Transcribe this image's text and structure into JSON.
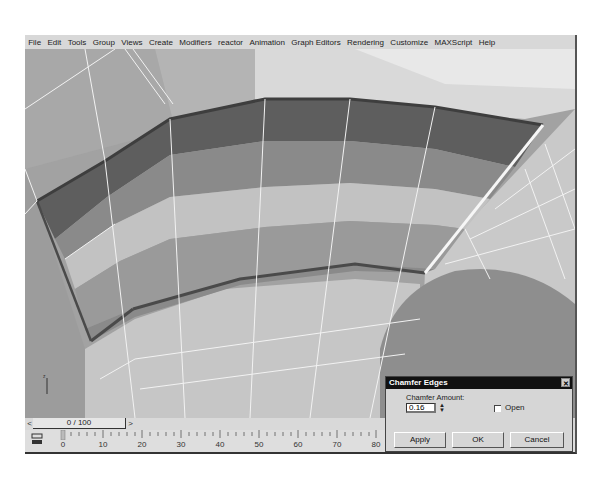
{
  "menubar": {
    "items": [
      {
        "label": "File",
        "accel": "F"
      },
      {
        "label": "Edit",
        "accel": "E"
      },
      {
        "label": "Tools",
        "accel": "T"
      },
      {
        "label": "Group",
        "accel": "G"
      },
      {
        "label": "Views",
        "accel": "V"
      },
      {
        "label": "Create",
        "accel": "C"
      },
      {
        "label": "Modifiers",
        "accel": "o"
      },
      {
        "label": "reactor",
        "accel": ""
      },
      {
        "label": "Animation",
        "accel": "A"
      },
      {
        "label": "Graph Editors",
        "accel": ""
      },
      {
        "label": "Rendering",
        "accel": "R"
      },
      {
        "label": "Customize",
        "accel": "u"
      },
      {
        "label": "MAXScript",
        "accel": "M"
      },
      {
        "label": "Help",
        "accel": "H"
      }
    ]
  },
  "viewport": {
    "axis_label": "z",
    "colors": {
      "background": "#9a9a9a",
      "selected_dark_faces": "#5c5c5c",
      "selected_mid_faces": "#8a8a8a",
      "selected_light_faces": "#bdbdbd",
      "wire": "#f2f2f2",
      "outline": "#4a4a4a"
    }
  },
  "timeslider": {
    "left_arrow": "<",
    "right_arrow": ">",
    "position_label": "0 / 100"
  },
  "trackbar": {
    "ticks": [
      "0",
      "10",
      "20",
      "30",
      "40",
      "50",
      "60",
      "70",
      "80"
    ]
  },
  "dialog": {
    "title": "Chamfer Edges",
    "close_glyph": "✕",
    "amount_label": "Chamfer Amount:",
    "amount_value": "0.16",
    "spinner_glyph": "▲▼",
    "open_label": "Open",
    "open_checked": false,
    "buttons": {
      "apply": "Apply",
      "ok": "OK",
      "cancel": "Cancel"
    }
  }
}
